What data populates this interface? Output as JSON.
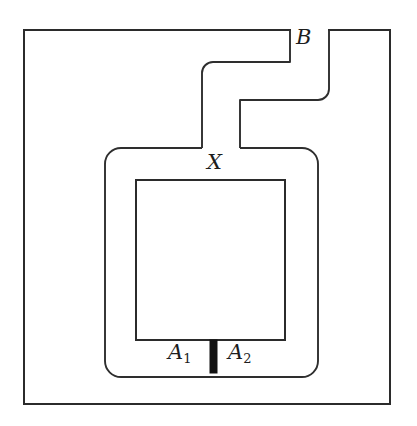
{
  "figure": {
    "type": "topological-diagram",
    "background_color": "#ffffff",
    "stroke_color": "#2b2b2b",
    "bar_color": "#121212",
    "labels": [
      {
        "id": "B",
        "text": "B",
        "sub": "",
        "x": 296,
        "y": 27
      },
      {
        "id": "X",
        "text": "X",
        "sub": "",
        "x": 207,
        "y": 152
      },
      {
        "id": "A1",
        "text": "A",
        "sub": "1",
        "x": 168,
        "y": 342
      },
      {
        "id": "A2",
        "text": "A",
        "sub": "2",
        "x": 228,
        "y": 342
      }
    ],
    "geometry": {
      "outer_rect": {
        "x": 24,
        "y": 30,
        "width": 366,
        "height": 374
      },
      "inner_rect": {
        "x": 136,
        "y": 180,
        "width": 149,
        "height": 160
      },
      "outer_loop": {
        "x": 105,
        "y": 148,
        "width": 213,
        "height": 229,
        "corner_radius": 16
      },
      "arc_bar": {
        "x": 210,
        "y": 340,
        "width": 7,
        "height": 33
      }
    }
  }
}
